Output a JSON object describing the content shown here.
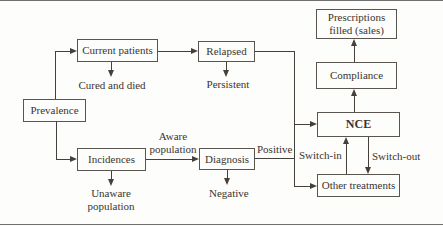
{
  "diagram": {
    "nodes": {
      "prevalence": "Prevalence",
      "current_patients": "Current patients",
      "relapsed": "Relapsed",
      "incidences": "Incidences",
      "diagnosis": "Diagnosis",
      "nce": "NCE",
      "compliance": "Compliance",
      "prescriptions": "Prescriptions filled (sales)",
      "other_treatments": "Other treatments"
    },
    "labels": {
      "cured_and_died": "Cured and died",
      "persistent": "Persistent",
      "aware_population": "Aware population",
      "positive": "Positive",
      "negative": "Negative",
      "unaware_population": "Unaware population",
      "switch_in": "Switch-in",
      "switch_out": "Switch-out"
    },
    "colors": {
      "ink": "#45403a",
      "box_border": "#5a554f",
      "background": "#fdfdfc",
      "figure_rule": "#6f6f6f"
    }
  }
}
